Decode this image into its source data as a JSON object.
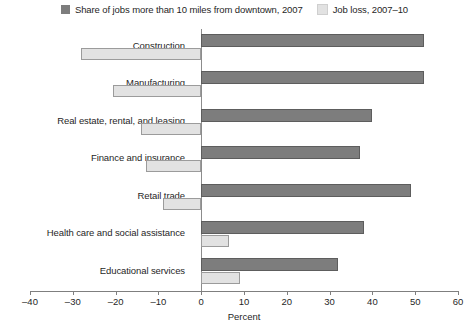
{
  "legend": {
    "items": [
      {
        "label": "Share of jobs more than 10 miles from downtown, 2007",
        "color": "#7d7d7d",
        "icon": "legend-swatch-icon"
      },
      {
        "label": "Job loss, 2007–10",
        "color": "#e2e2e2",
        "icon": "legend-swatch-icon"
      }
    ]
  },
  "axis": {
    "x_title": "Percent",
    "ticks": [
      "–40",
      "–30",
      "–20",
      "–10",
      "0",
      "10",
      "20",
      "30",
      "40",
      "50",
      "60"
    ]
  },
  "chart_data": {
    "type": "bar",
    "orientation": "horizontal",
    "title": "",
    "xlabel": "Percent",
    "ylabel": "",
    "xlim": [
      -40,
      60
    ],
    "xticks": [
      -40,
      -30,
      -20,
      -10,
      0,
      10,
      20,
      30,
      40,
      50,
      60
    ],
    "grid": false,
    "legend_position": "top-center",
    "categories": [
      "Construction",
      "Manufacturing",
      "Real estate, rental, and leasing",
      "Finance and insurance",
      "Retail trade",
      "Health care and social assistance",
      "Educational services"
    ],
    "series": [
      {
        "name": "Share of jobs more than 10 miles from downtown, 2007",
        "color": "#7d7d7d",
        "values": [
          52,
          52,
          40,
          37,
          49,
          38,
          32
        ]
      },
      {
        "name": "Job loss, 2007–10",
        "color": "#e2e2e2",
        "values": [
          -28,
          -20.5,
          -14,
          -13,
          -9,
          6.5,
          9
        ]
      }
    ]
  }
}
